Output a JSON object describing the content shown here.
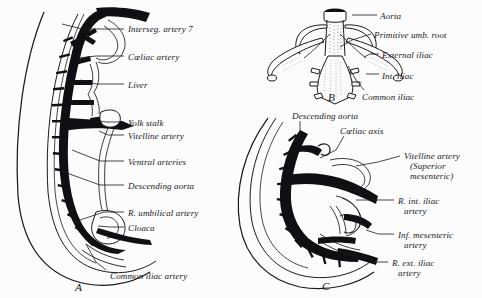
{
  "figure": {
    "background_color": "#fcfcfc",
    "ink_color": "#101014",
    "line_color": "#1a1a1e"
  },
  "panels": [
    {
      "id": "A",
      "letter": "A",
      "letter_x": 75,
      "letter_y": 281,
      "labels": [
        {
          "name": "interseg-artery-7",
          "text": "Interseg. artery 7",
          "x": 128,
          "y": 24,
          "leader": [
            [
              124,
              29
            ],
            [
              82,
              29
            ],
            [
              62,
              24
            ]
          ]
        },
        {
          "name": "coeliac-artery",
          "text": "Cœliac artery",
          "x": 128,
          "y": 52,
          "leader": [
            [
              124,
              56
            ],
            [
              96,
              56
            ],
            [
              78,
              58
            ]
          ]
        },
        {
          "name": "liver",
          "text": "Liver",
          "x": 128,
          "y": 80,
          "leader": [
            [
              124,
              84
            ],
            [
              96,
              84
            ],
            [
              80,
              80
            ]
          ]
        },
        {
          "name": "yolk-stalk",
          "text": "Yolk stalk",
          "x": 128,
          "y": 118,
          "leader": [
            [
              124,
              122
            ],
            [
              106,
              122
            ],
            [
              100,
              121
            ]
          ]
        },
        {
          "name": "vitelline-artery",
          "text": "Vitelline artery",
          "x": 128,
          "y": 131,
          "leader": [
            [
              124,
              135
            ],
            [
              108,
              135
            ],
            [
              99,
              131
            ]
          ]
        },
        {
          "name": "ventral-arteries",
          "text": "Ventral arteries",
          "x": 128,
          "y": 157,
          "leader": [
            [
              124,
              161
            ],
            [
              100,
              161
            ],
            [
              72,
              150
            ]
          ]
        },
        {
          "name": "descending-aorta",
          "text": "Descending aorta",
          "x": 128,
          "y": 181,
          "leader": [
            [
              124,
              185
            ],
            [
              100,
              185
            ],
            [
              64,
              172
            ]
          ]
        },
        {
          "name": "r-umbilical-artery",
          "text": "R. umbilical artery",
          "x": 128,
          "y": 208,
          "leader": [
            [
              124,
              212
            ],
            [
              104,
              212
            ],
            [
              74,
              222
            ]
          ]
        },
        {
          "name": "cloaca",
          "text": "Cloaca",
          "x": 128,
          "y": 223,
          "leader": [
            [
              124,
              227
            ],
            [
              110,
              227
            ],
            [
              98,
              226
            ]
          ]
        },
        {
          "name": "common-iliac-artery",
          "text": "Common iliac artery",
          "x": 110,
          "y": 271,
          "leader": [
            [
              106,
              270
            ],
            [
              96,
              262
            ],
            [
              86,
              244
            ]
          ]
        }
      ]
    },
    {
      "id": "B",
      "letter": "B",
      "letter_x": 328,
      "letter_y": 91,
      "labels": [
        {
          "name": "aorta",
          "text": "Aorta",
          "x": 380,
          "y": 11,
          "leader": [
            [
              377,
              15
            ],
            [
              362,
              15
            ],
            [
              352,
              15
            ]
          ]
        },
        {
          "name": "primitive-umb-root",
          "text": "Primitive umb. root",
          "x": 374,
          "y": 30,
          "leader": [
            [
              371,
              34
            ],
            [
              352,
              40
            ],
            [
              340,
              47
            ]
          ]
        },
        {
          "name": "external-iliac",
          "text": "External iliac",
          "x": 382,
          "y": 50,
          "leader": [
            [
              379,
              54
            ],
            [
              370,
              54
            ],
            [
              364,
              57
            ]
          ]
        },
        {
          "name": "int-iliac",
          "text": "Int. iliac",
          "x": 382,
          "y": 71,
          "leader": [
            [
              379,
              74
            ],
            [
              372,
              74
            ],
            [
              366,
              74
            ]
          ]
        },
        {
          "name": "common-iliac",
          "text": "Common iliac",
          "x": 362,
          "y": 92,
          "leader": [
            [
              364,
              90
            ],
            [
              356,
              80
            ],
            [
              348,
              66
            ]
          ]
        }
      ]
    },
    {
      "id": "C",
      "letter": "C",
      "letter_x": 322,
      "letter_y": 280,
      "labels": [
        {
          "name": "descending-aorta-c",
          "text": "Descending aorta",
          "x": 292,
          "y": 111,
          "leader": [
            [
              300,
              121
            ],
            [
              300,
              134
            ],
            [
              296,
              141
            ]
          ]
        },
        {
          "name": "coeliac-axis",
          "text": "Cœliac axis",
          "x": 340,
          "y": 126,
          "leader": [
            [
              344,
              136
            ],
            [
              336,
              150
            ],
            [
              320,
              158
            ]
          ]
        },
        {
          "name": "vitelline-artery-c",
          "text": "Vitelline artery",
          "x": 404,
          "y": 151,
          "leader": [
            [
              400,
              156
            ],
            [
              378,
              162
            ],
            [
              356,
              166
            ]
          ]
        },
        {
          "name": "vitelline-superior",
          "text": "(Superior",
          "x": 410,
          "y": 161,
          "no_leader": true
        },
        {
          "name": "vitelline-mesenteric",
          "text": "mesenteric)",
          "x": 410,
          "y": 171,
          "no_leader": true
        },
        {
          "name": "r-int-iliac-artery",
          "text": "R. int. iliac",
          "x": 398,
          "y": 196,
          "leader": [
            [
              394,
              200
            ],
            [
              370,
              200
            ],
            [
              356,
              200
            ]
          ]
        },
        {
          "name": "r-int-iliac-artery-2",
          "text": "artery",
          "x": 404,
          "y": 206,
          "no_leader": true
        },
        {
          "name": "inf-mesenteric-artery",
          "text": "Inf. mesenteric",
          "x": 398,
          "y": 230,
          "leader": [
            [
              394,
              234
            ],
            [
              378,
              234
            ],
            [
              366,
              230
            ]
          ]
        },
        {
          "name": "inf-mesenteric-artery-2",
          "text": "artery",
          "x": 404,
          "y": 240,
          "no_leader": true
        },
        {
          "name": "r-ext-iliac-artery",
          "text": "R. ext. iliac",
          "x": 392,
          "y": 258,
          "leader": [
            [
              388,
              262
            ],
            [
              374,
              262
            ],
            [
              362,
              254
            ]
          ]
        },
        {
          "name": "r-ext-iliac-artery-2",
          "text": "artery",
          "x": 398,
          "y": 268,
          "no_leader": true
        }
      ]
    }
  ]
}
